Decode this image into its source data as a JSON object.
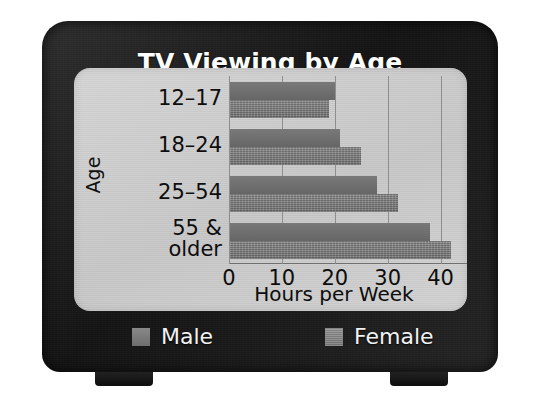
{
  "figure": {
    "title": "TV Viewing by Age",
    "device": "television-illustration",
    "screen_bg_color": "#c9c9c9",
    "bezel_color": "#1d1d1d"
  },
  "chart_data": {
    "type": "bar",
    "orientation": "horizontal",
    "title": "TV Viewing by Age",
    "xlabel": "Hours per Week",
    "ylabel": "Age",
    "categories": [
      "12–17",
      "18–24",
      "25–54",
      "55 & older"
    ],
    "series": [
      {
        "name": "Male",
        "color": "#6f6f6f",
        "values": [
          20,
          21,
          28,
          38
        ]
      },
      {
        "name": "Female",
        "color": "#7c7c7c",
        "values": [
          19,
          25,
          32,
          42
        ]
      }
    ],
    "xlim": [
      0,
      45
    ],
    "xticks": [
      0,
      10,
      20,
      30,
      40
    ],
    "xtick_labels": [
      "0",
      "10",
      "20",
      "30",
      "40"
    ],
    "grid": true,
    "legend_position": "bottom"
  },
  "legend": {
    "items": [
      {
        "label": "Male",
        "swatch": "male-swatch"
      },
      {
        "label": "Female",
        "swatch": "female-swatch"
      }
    ]
  },
  "category_labels": [
    {
      "line1": "12–17",
      "line2": ""
    },
    {
      "line1": "18–24",
      "line2": ""
    },
    {
      "line1": "25–54",
      "line2": ""
    },
    {
      "line1": "55 &",
      "line2": "older"
    }
  ]
}
